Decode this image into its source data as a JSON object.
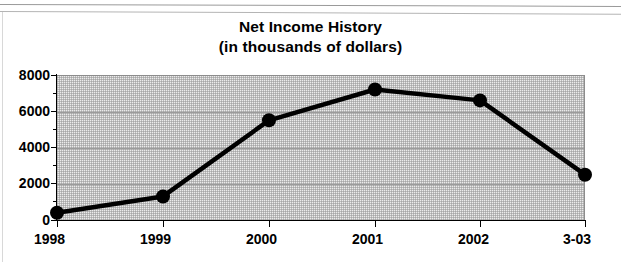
{
  "chart_data": {
    "type": "line",
    "title": "Net Income History",
    "subtitle": "(in thousands of dollars)",
    "xlabel": "",
    "ylabel": "",
    "categories": [
      "1998",
      "1999",
      "2000",
      "2001",
      "2002",
      "3-03"
    ],
    "values": [
      400,
      1300,
      5500,
      7200,
      6600,
      2500
    ],
    "series": [
      {
        "name": "Net Income",
        "values": [
          400,
          1300,
          5500,
          7200,
          6600,
          2500
        ]
      }
    ],
    "ylim": [
      0,
      8000
    ],
    "ytick_labels": [
      "0",
      "2000",
      "4000",
      "6000",
      "8000"
    ],
    "ytick_values": [
      0,
      2000,
      4000,
      6000,
      8000
    ],
    "yminor_tick_values": [
      1000,
      3000,
      5000,
      7000
    ],
    "xtick_labels": [
      "1998",
      "1999",
      "2000",
      "2001",
      "2002",
      "3-03"
    ],
    "grid": true,
    "grid_axis": "y",
    "legend": false,
    "legend_position": "none",
    "marker": "circle",
    "colors": {
      "line": "#000000",
      "marker": "#000000",
      "plot_background": "#ebebeb",
      "gridline": "#9b9b9b",
      "axis": "#000000",
      "text": "#000000",
      "page_background": "#ffffff"
    }
  }
}
